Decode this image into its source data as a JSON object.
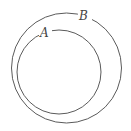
{
  "diagram": {
    "type": "venn-subset",
    "stroke_color": "#5a5a5a",
    "background": "#ffffff",
    "sets": [
      {
        "id": "B",
        "label": "B",
        "role": "outer",
        "cx": 66.5,
        "cy": 68,
        "r": 55,
        "label_x": 84,
        "label_y": 20
      },
      {
        "id": "A",
        "label": "A",
        "role": "inner",
        "cx": 59,
        "cy": 72,
        "r": 42,
        "label_x": 44,
        "label_y": 37
      }
    ]
  }
}
